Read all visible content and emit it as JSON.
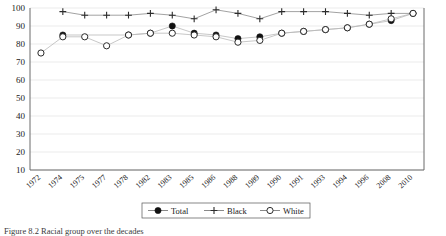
{
  "chart_data": {
    "type": "line",
    "title": "",
    "xlabel": "",
    "ylabel": "",
    "ylim": [
      10,
      100
    ],
    "ytick_step": 10,
    "grid": true,
    "legend_position": "bottom-center",
    "yticks": [
      "100",
      "90",
      "80",
      "70",
      "60",
      "50",
      "40",
      "30",
      "20",
      "10"
    ],
    "categories": [
      "1972",
      "1974",
      "1975",
      "1977",
      "1978",
      "1982",
      "1983",
      "1985",
      "1986",
      "1988",
      "1989",
      "1990",
      "1991",
      "1993",
      "1994",
      "1996",
      "2008",
      "2010"
    ],
    "series": [
      {
        "name": "Total",
        "marker": "filled-circle",
        "values": [
          null,
          85,
          null,
          null,
          85,
          86,
          90,
          86,
          85,
          83,
          84,
          86,
          87,
          88,
          89,
          91,
          93,
          97
        ]
      },
      {
        "name": "Black",
        "marker": "plus",
        "values": [
          null,
          98,
          96,
          96,
          96,
          97,
          96,
          94,
          99,
          97,
          94,
          98,
          98,
          98,
          97,
          96,
          97,
          97
        ]
      },
      {
        "name": "White",
        "marker": "open-circle",
        "values": [
          75,
          84,
          84,
          79,
          85,
          86,
          86,
          85,
          84,
          81,
          82,
          86,
          87,
          88,
          89,
          91,
          94,
          97
        ]
      }
    ]
  },
  "legend": {
    "entries": [
      {
        "label": "Total",
        "marker": "filled-circle"
      },
      {
        "label": "Black",
        "marker": "plus"
      },
      {
        "label": "White",
        "marker": "open-circle"
      }
    ]
  },
  "caption": {
    "figure_number": "Figure 8.2",
    "text": "Racial group over the decades"
  },
  "colors": {
    "marker_total": "#111111",
    "marker_white_fill": "#ffffff",
    "marker_stroke": "#2b2b2b",
    "gridline": "#e3e3e3",
    "axis": "#6b6b6b",
    "series_line": "#b9b9b9"
  }
}
